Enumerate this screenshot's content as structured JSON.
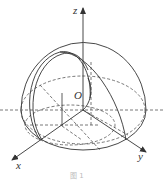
{
  "figure": {
    "axes": {
      "x_label": "x",
      "y_label": "y",
      "z_label": "z",
      "origin_label": "O"
    },
    "caption": "图 1",
    "colors": {
      "line": "#333333",
      "dashed": "#555555",
      "caption": "#bbbbbb"
    }
  }
}
